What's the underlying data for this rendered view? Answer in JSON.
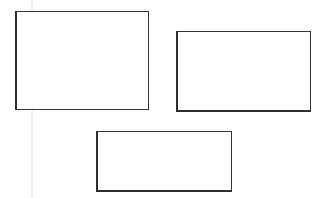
{
  "canvas": {
    "width": 329,
    "height": 198,
    "background_color": "#ffffff",
    "description": "Three empty outlined rectangles on a plain white background"
  },
  "artifacts": [
    {
      "name": "vertical-scan-line",
      "type": "faint-vertical-line",
      "x": 31,
      "color": "#e2e6eb",
      "opacity": "0.75"
    }
  ],
  "shapes": [
    {
      "id": "rectangle-1",
      "label": "",
      "shape": "rectangle",
      "x": 15,
      "y": 11,
      "width": 134,
      "height": 99,
      "border_color": "#353535",
      "border_width": 1,
      "fill_color": "#ffffff",
      "position": "top-left"
    },
    {
      "id": "rectangle-2",
      "label": "",
      "shape": "rectangle",
      "x": 176,
      "y": 31,
      "width": 135,
      "height": 81,
      "border_color": "#353535",
      "border_width": 1,
      "fill_color": "#ffffff",
      "position": "top-right"
    },
    {
      "id": "rectangle-3",
      "label": "",
      "shape": "rectangle",
      "x": 96,
      "y": 131,
      "width": 136,
      "height": 61,
      "border_color": "#353535",
      "border_width": 1,
      "fill_color": "#ffffff",
      "position": "bottom-center"
    }
  ]
}
